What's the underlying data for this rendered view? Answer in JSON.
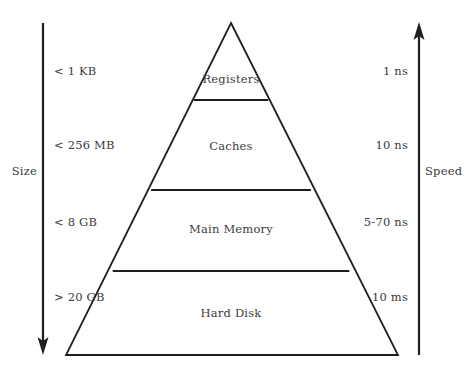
{
  "diagram": {
    "type": "memory-hierarchy-pyramid",
    "tiers": [
      {
        "name": "Registers",
        "size": "< 1 KB",
        "speed": "1 ns"
      },
      {
        "name": "Caches",
        "size": "< 256 MB",
        "speed": "10 ns"
      },
      {
        "name": "Main Memory",
        "size": "< 8 GB",
        "speed": "5-70 ns"
      },
      {
        "name": "Hard Disk",
        "size": "> 20 GB",
        "speed": "10 ms"
      }
    ],
    "axes": {
      "left": {
        "title": "Size",
        "direction": "down"
      },
      "right": {
        "title": "Speed",
        "direction": "up"
      }
    },
    "colors": {
      "stroke": "#1f1f1f",
      "text": "#3c3c3c",
      "background": "#ffffff"
    }
  }
}
